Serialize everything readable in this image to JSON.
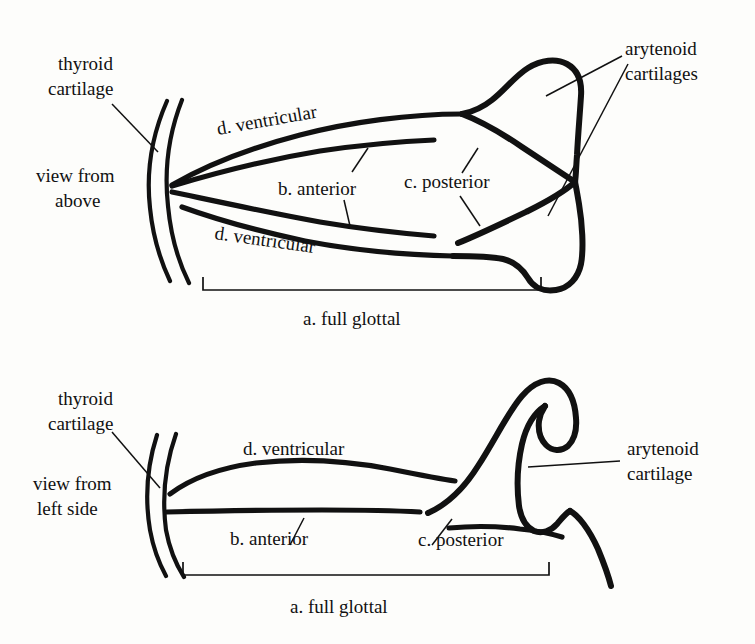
{
  "figure": {
    "background_color": "#fdfdfb",
    "ink_color": "#111111"
  },
  "panels": [
    {
      "id": "view-from-above",
      "view_label_line1": "view from",
      "view_label_line2": "above",
      "thyroid_label_line1": "thyroid",
      "thyroid_label_line2": "cartilage",
      "arytenoid_label_line1": "arytenoid",
      "arytenoid_label_line2": "cartilages",
      "parts": [
        {
          "key": "ventricular_upper",
          "label": "d. ventricular"
        },
        {
          "key": "anterior",
          "label": "b. anterior"
        },
        {
          "key": "posterior",
          "label": "c. posterior"
        },
        {
          "key": "ventricular_lower",
          "label": "d. ventricular"
        }
      ],
      "bracket_label": "a. full glottal"
    },
    {
      "id": "view-from-left-side",
      "view_label_line1": "view from",
      "view_label_line2": "left side",
      "thyroid_label_line1": "thyroid",
      "thyroid_label_line2": "cartilage",
      "arytenoid_label_line1": "arytenoid",
      "arytenoid_label_line2": "cartilage",
      "parts": [
        {
          "key": "ventricular",
          "label": "d. ventricular"
        },
        {
          "key": "anterior",
          "label": "b. anterior"
        },
        {
          "key": "posterior",
          "label": "c. posterior"
        }
      ],
      "bracket_label": "a. full glottal"
    }
  ],
  "top": {
    "thyroid_l1": "thyroid",
    "thyroid_l2": "cartilage",
    "view_l1": "view from",
    "view_l2": "above",
    "arytenoid_l1": "arytenoid",
    "arytenoid_l2": "cartilages",
    "ventricular_upper": "d. ventricular",
    "ventricular_lower": "d. ventricular",
    "anterior": "b. anterior",
    "posterior": "c. posterior",
    "bracket": "a. full glottal"
  },
  "bottom": {
    "thyroid_l1": "thyroid",
    "thyroid_l2": "cartilage",
    "view_l1": "view from",
    "view_l2": "left side",
    "arytenoid_l1": "arytenoid",
    "arytenoid_l2": "cartilage",
    "ventricular": "d. ventricular",
    "anterior": "b. anterior",
    "posterior": "c. posterior",
    "bracket": "a. full glottal"
  }
}
